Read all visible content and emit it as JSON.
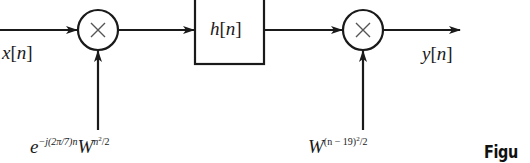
{
  "diagram": {
    "type": "block-diagram",
    "input_label": {
      "base": "x",
      "arg": "n"
    },
    "output_label": {
      "base": "y",
      "arg": "n"
    },
    "multiplier_1": {
      "symbol": "×"
    },
    "filter_block": {
      "base": "h",
      "arg": "n"
    },
    "multiplier_2": {
      "symbol": "×"
    },
    "modulator_1": {
      "base": "e",
      "exponent": "−j(2π/7)n",
      "factor_base": "W",
      "factor_exp_base": "n",
      "factor_exp_power": "2",
      "factor_exp_tail": "/2"
    },
    "modulator_2": {
      "base": "W",
      "exp_head": "(n − 19)",
      "exp_power": "2",
      "exp_tail": "/2"
    },
    "colors": {
      "stroke": "#1a1a1a",
      "background": "#ffffff"
    }
  },
  "caption": {
    "text": "Figu"
  }
}
